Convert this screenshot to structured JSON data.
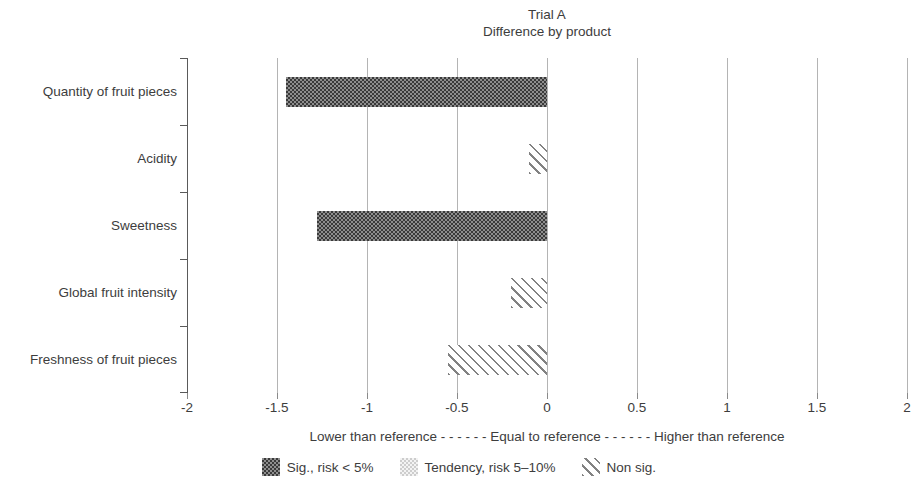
{
  "page": {
    "background": "#ffffff"
  },
  "chart_data": {
    "type": "bar",
    "orientation": "horizontal",
    "title": "Trial A",
    "subtitle": "Difference by product",
    "categories": [
      "Quantity of fruit pieces",
      "Acidity",
      "Sweetness",
      "Global fruit intensity",
      "Freshness of fruit pieces"
    ],
    "values": [
      -1.45,
      -0.1,
      -1.28,
      -0.2,
      -0.55
    ],
    "significance": [
      "sig",
      "nonsig",
      "sig",
      "nonsig",
      "nonsig"
    ],
    "bar_baseline": 0,
    "xlim": [
      -2,
      2
    ],
    "xticks": [
      -2,
      -1.5,
      -1,
      -0.5,
      0,
      0.5,
      1,
      1.5,
      2
    ],
    "xtick_labels": [
      "-2",
      "-1.5",
      "-1",
      "-0.5",
      "0",
      "0.5",
      "1",
      "1.5",
      "2"
    ],
    "grid": true,
    "legend_position": "bottom",
    "annotation": "Lower than reference - - - - - - Equal to reference - - - - - - Higher than reference",
    "legend": [
      {
        "pattern": "sig",
        "label": "Sig., risk < 5%"
      },
      {
        "pattern": "tendency",
        "label": "Tendency, risk 5–10%"
      },
      {
        "pattern": "nonsig",
        "label": "Non sig."
      }
    ],
    "colors": {
      "sig_checker_dark": "#3a3a3a",
      "sig_checker_light": "#8e8e8e",
      "tendency_checker_dark": "#cdcdcd",
      "tendency_checker_light": "#f3f3f3",
      "hatch_line": "#828282",
      "gridline": "#b4b4b4",
      "axis": "#5a5a5a",
      "text": "#3d3d3d",
      "background": "#ffffff"
    }
  }
}
